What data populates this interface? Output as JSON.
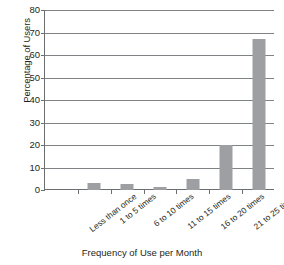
{
  "chart_data": {
    "type": "bar",
    "title": "",
    "xlabel": "Frequency of Use per Month",
    "ylabel": "Percentage of Users",
    "categories": [
      "Less than once",
      "1 to 5 times",
      "6 to 10 times",
      "11 to 15 times",
      "16 to 20 times",
      "21 to 25 times",
      "26 to 31 times"
    ],
    "values": [
      0,
      3,
      2.5,
      1.5,
      5,
      20,
      67
    ],
    "ylim": [
      0,
      80
    ],
    "yticks": [
      0,
      10,
      20,
      30,
      40,
      50,
      60,
      70,
      80
    ],
    "ytick_labels": [
      "0",
      "10",
      "20",
      "30",
      "40",
      "50",
      "60",
      "70",
      "80"
    ],
    "grid": "horizontal",
    "legend": "none",
    "bar_color": "#9d9fa2",
    "axis_color": "#6d6e71",
    "grid_color": "#808285",
    "text_color": "#231f20",
    "background": "#ffffff"
  }
}
